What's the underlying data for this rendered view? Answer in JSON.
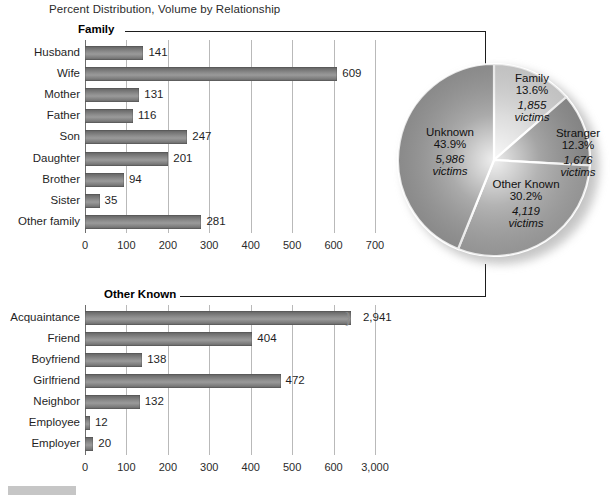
{
  "figure": {
    "title": "Percent Distribution, Volume by Relationship"
  },
  "panels": {
    "family": {
      "header_label": "Family",
      "axis": {
        "min": 0,
        "max": 700,
        "ticks": [
          "0",
          "100",
          "200",
          "300",
          "400",
          "500",
          "600",
          "700"
        ]
      },
      "categories": [
        "Husband",
        "Wife",
        "Mother",
        "Father",
        "Son",
        "Daughter",
        "Brother",
        "Sister",
        "Other family"
      ],
      "values": [
        141,
        609,
        131,
        116,
        247,
        201,
        94,
        35,
        281
      ],
      "value_labels": [
        "141",
        "609",
        "131",
        "116",
        "247",
        "201",
        "94",
        "35",
        "281"
      ]
    },
    "other_known": {
      "header_label": "Other Known",
      "axis": {
        "min": 0,
        "max": 700,
        "ticks": [
          "0",
          "100",
          "200",
          "300",
          "400",
          "500",
          "600",
          "3,000"
        ],
        "broken_after": "600"
      },
      "categories": [
        "Acquaintance",
        "Friend",
        "Boyfriend",
        "Girlfriend",
        "Neighbor",
        "Employee",
        "Employer"
      ],
      "values": [
        2941,
        404,
        138,
        472,
        132,
        12,
        20
      ],
      "value_labels": [
        "2,941",
        "404",
        "138",
        "472",
        "132",
        "12",
        "20"
      ],
      "broken_bar_index": 0
    }
  },
  "pie": {
    "slices": [
      {
        "name": "Family",
        "percent": "13.6%",
        "count": "1,855",
        "unit": "victims",
        "value": 13.6,
        "color": "#d3d3d3"
      },
      {
        "name": "Stranger",
        "percent": "12.3%",
        "count": "1,676",
        "unit": "victims",
        "value": 12.3,
        "color": "#8c8c8c"
      },
      {
        "name": "Other Known",
        "percent": "30.2%",
        "count": "4,119",
        "unit": "victims",
        "value": 30.2,
        "color": "#9e9e9e"
      },
      {
        "name": "Unknown",
        "percent": "43.9%",
        "count": "5,986",
        "unit": "victims",
        "value": 43.9,
        "color": "#939393"
      }
    ]
  },
  "chart_data": {
    "type": "bar",
    "title": "Percent Distribution, Volume by Relationship",
    "charts": [
      {
        "type": "bar",
        "orientation": "horizontal",
        "title": "Family",
        "categories": [
          "Husband",
          "Wife",
          "Mother",
          "Father",
          "Son",
          "Daughter",
          "Brother",
          "Sister",
          "Other family"
        ],
        "values": [
          141,
          609,
          131,
          116,
          247,
          201,
          94,
          35,
          281
        ],
        "xlabel": "",
        "ylabel": "",
        "xlim": [
          0,
          700
        ],
        "xticks": [
          0,
          100,
          200,
          300,
          400,
          500,
          600,
          700
        ],
        "grid": true,
        "legend": "none"
      },
      {
        "type": "bar",
        "orientation": "horizontal",
        "title": "Other Known",
        "categories": [
          "Acquaintance",
          "Friend",
          "Boyfriend",
          "Girlfriend",
          "Neighbor",
          "Employee",
          "Employer"
        ],
        "values": [
          2941,
          404,
          138,
          472,
          132,
          12,
          20
        ],
        "xlabel": "",
        "ylabel": "",
        "xlim": [
          0,
          700
        ],
        "xticks": [
          0,
          100,
          200,
          300,
          400,
          500,
          600,
          3000
        ],
        "axis_break": "between 600 and 3,000",
        "grid": true,
        "legend": "none"
      },
      {
        "type": "pie",
        "title": "",
        "categories": [
          "Family",
          "Stranger",
          "Other Known",
          "Unknown"
        ],
        "values": [
          13.6,
          12.3,
          30.2,
          43.9
        ],
        "counts": [
          1855,
          1676,
          4119,
          5986
        ],
        "unit": "victims",
        "legend": "labels-on-slices"
      }
    ]
  }
}
